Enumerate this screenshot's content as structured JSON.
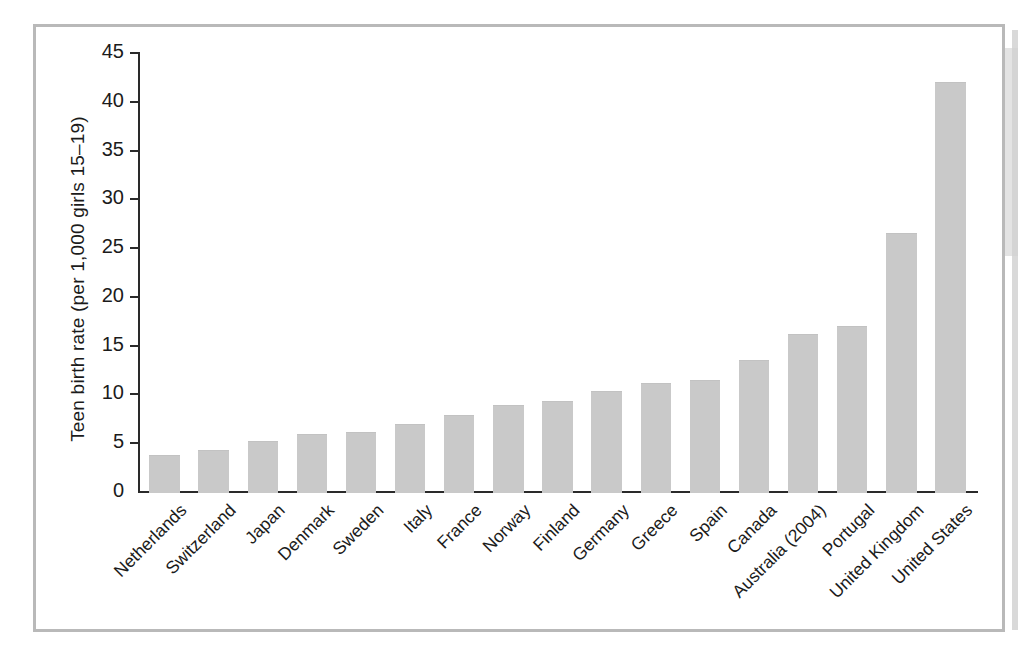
{
  "figure": {
    "frame_border_color": "#b9b9b9",
    "background_color": "#ffffff"
  },
  "chart_data": {
    "type": "bar",
    "title": "",
    "xlabel": "",
    "ylabel": "Teen birth rate (per 1,000 girls 15–19)",
    "ylim": [
      0,
      45
    ],
    "yticks": [
      0,
      5,
      10,
      15,
      20,
      25,
      30,
      35,
      40,
      45
    ],
    "ytick_labels": [
      "0",
      "5",
      "10",
      "15",
      "20",
      "25",
      "30",
      "35",
      "40",
      "45"
    ],
    "grid": false,
    "legend": null,
    "bar_color": "#c9c9c9",
    "axis_color": "#2a2a2a",
    "categories": [
      "Netherlands",
      "Switzerland",
      "Japan",
      "Denmark",
      "Sweden",
      "Italy",
      "France",
      "Norway",
      "Finland",
      "Germany",
      "Greece",
      "Spain",
      "Canada",
      "Australia (2004)",
      "Portugal",
      "United Kingdom",
      "United States"
    ],
    "values": [
      3.8,
      4.3,
      5.2,
      5.9,
      6.2,
      7.0,
      7.9,
      8.9,
      9.3,
      10.4,
      11.2,
      11.5,
      13.5,
      16.2,
      17.0,
      26.6,
      42.0
    ]
  }
}
